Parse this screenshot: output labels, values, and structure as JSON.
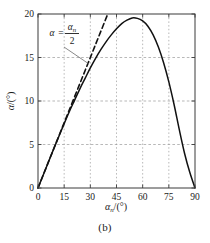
{
  "figure": {
    "caption": "(b)"
  },
  "chart_data": {
    "type": "line",
    "title": "",
    "xlabel": "αₙ /(°)",
    "ylabel": "α /(°)",
    "xlabel_symbol": "α",
    "xlabel_sub": "n",
    "xlabel_unit": "/(°)",
    "ylabel_symbol": "α",
    "ylabel_unit": "/(°)",
    "xlim": [
      0,
      90
    ],
    "ylim": [
      0,
      20
    ],
    "xticks": [
      0,
      15,
      30,
      45,
      60,
      75,
      90
    ],
    "yticks": [
      0,
      5,
      10,
      15,
      20
    ],
    "xtick_labels": [
      "0",
      "15",
      "30",
      "45",
      "60",
      "75",
      "90"
    ],
    "ytick_labels": [
      "0",
      "5",
      "10",
      "15",
      "20"
    ],
    "grid": true,
    "grid_style": "dashed",
    "grid_color": "#9a9a9a",
    "axis_color": "#3a3a3a",
    "legend": "none",
    "series": [
      {
        "name": "alpha-curve",
        "style": "solid",
        "color": "#111111",
        "x": [
          0,
          3,
          6,
          9,
          12,
          15,
          18,
          21,
          24,
          27,
          30,
          33,
          36,
          39,
          42,
          45,
          48,
          51,
          54,
          57,
          60,
          63,
          66,
          69,
          72,
          75,
          78,
          81,
          84,
          87,
          90
        ],
        "y": [
          0,
          1.5,
          3.0,
          4.5,
          5.95,
          7.4,
          8.8,
          10.1,
          11.4,
          12.6,
          13.8,
          14.9,
          15.9,
          16.8,
          17.6,
          18.3,
          18.9,
          19.3,
          19.55,
          19.5,
          19.2,
          18.6,
          17.6,
          16.2,
          14.4,
          12.2,
          9.6,
          6.7,
          4.0,
          1.8,
          0
        ]
      },
      {
        "name": "asymptote-alpha-n-over-2",
        "style": "dashed",
        "color": "#111111",
        "x": [
          0,
          45
        ],
        "y": [
          0,
          22.5
        ]
      }
    ],
    "annotations": [
      {
        "name": "alpha-equals-alpha-n-over-2",
        "text": "α = αₙ/2",
        "lhs": "α",
        "equals": "=",
        "numerator": "α",
        "numerator_sub": "n",
        "denominator": "2",
        "x": 11,
        "y": 17.4,
        "leader_to_x": 31,
        "leader_to_y": 15.1
      }
    ]
  }
}
